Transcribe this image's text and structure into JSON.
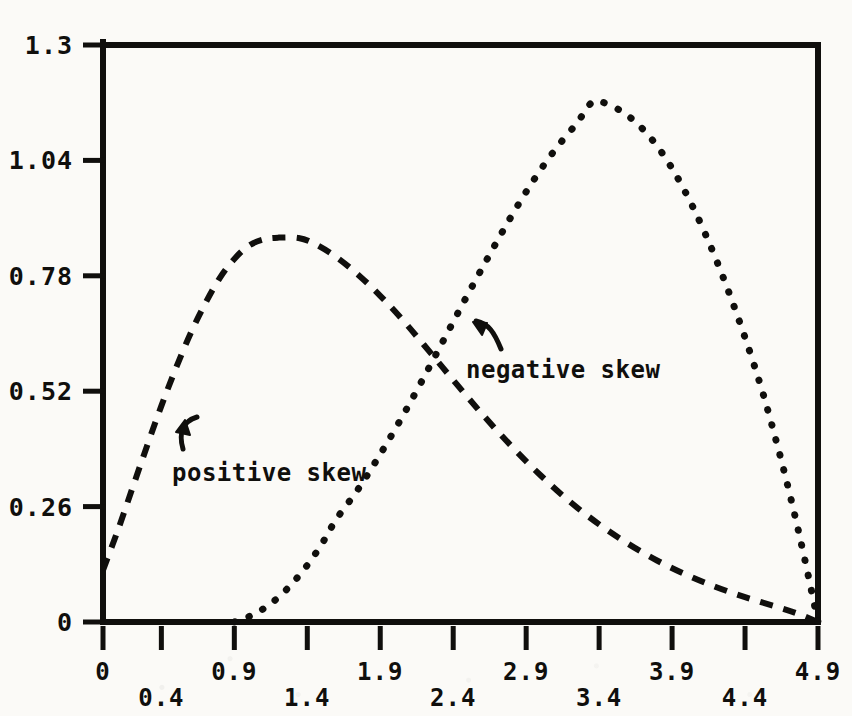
{
  "chart_data": {
    "type": "line",
    "title": "",
    "subtitle": "",
    "xlabel": "",
    "ylabel": "",
    "xlim": [
      0,
      4.9
    ],
    "ylim": [
      0,
      1.3
    ],
    "grid": false,
    "legend_position": "none",
    "x_tick_labels": [
      "0",
      "0.4",
      "0.9",
      "1.4",
      "1.9",
      "2.4",
      "2.9",
      "3.4",
      "3.9",
      "4.4",
      "4.9"
    ],
    "x_tick_values": [
      0,
      0.4,
      0.9,
      1.4,
      1.9,
      2.4,
      2.9,
      3.4,
      3.9,
      4.4,
      4.9
    ],
    "y_tick_labels": [
      "0",
      "0.26",
      "0.52",
      "0.78",
      "1.04",
      "1.3"
    ],
    "y_tick_values": [
      0,
      0.26,
      0.52,
      0.78,
      1.04,
      1.3
    ],
    "annotations": [
      {
        "text": "positive skew",
        "x": 0.72,
        "y": 0.41
      },
      {
        "text": "negative skew",
        "x": 2.6,
        "y": 0.62
      }
    ],
    "series": [
      {
        "name": "positive skew",
        "style": "dashed",
        "color": "#100f0d",
        "peak_x": 1.34,
        "peak_y": 0.865,
        "points": [
          [
            0.0,
            0.117
          ],
          [
            0.1,
            0.205
          ],
          [
            0.2,
            0.3
          ],
          [
            0.3,
            0.395
          ],
          [
            0.4,
            0.487
          ],
          [
            0.5,
            0.572
          ],
          [
            0.6,
            0.65
          ],
          [
            0.7,
            0.717
          ],
          [
            0.8,
            0.775
          ],
          [
            0.9,
            0.818
          ],
          [
            1.0,
            0.848
          ],
          [
            1.1,
            0.862
          ],
          [
            1.2,
            0.866
          ],
          [
            1.34,
            0.865
          ],
          [
            1.45,
            0.852
          ],
          [
            1.6,
            0.822
          ],
          [
            1.75,
            0.782
          ],
          [
            1.9,
            0.735
          ],
          [
            2.05,
            0.682
          ],
          [
            2.2,
            0.624
          ],
          [
            2.4,
            0.545
          ],
          [
            2.6,
            0.468
          ],
          [
            2.8,
            0.396
          ],
          [
            3.0,
            0.33
          ],
          [
            3.2,
            0.271
          ],
          [
            3.4,
            0.22
          ],
          [
            3.6,
            0.176
          ],
          [
            3.8,
            0.138
          ],
          [
            4.0,
            0.106
          ],
          [
            4.2,
            0.079
          ],
          [
            4.4,
            0.056
          ],
          [
            4.6,
            0.036
          ],
          [
            4.75,
            0.02
          ],
          [
            4.9,
            0.0
          ]
        ]
      },
      {
        "name": "negative skew",
        "style": "dotted",
        "color": "#100f0d",
        "peak_x": 3.35,
        "peak_y": 1.17,
        "points": [
          [
            0.9,
            0.0
          ],
          [
            1.0,
            0.012
          ],
          [
            1.1,
            0.03
          ],
          [
            1.2,
            0.055
          ],
          [
            1.3,
            0.088
          ],
          [
            1.4,
            0.128
          ],
          [
            1.5,
            0.176
          ],
          [
            1.6,
            0.232
          ],
          [
            1.75,
            0.3
          ],
          [
            1.9,
            0.378
          ],
          [
            2.05,
            0.462
          ],
          [
            2.2,
            0.552
          ],
          [
            2.35,
            0.645
          ],
          [
            2.5,
            0.738
          ],
          [
            2.65,
            0.828
          ],
          [
            2.8,
            0.915
          ],
          [
            2.95,
            0.995
          ],
          [
            3.1,
            1.065
          ],
          [
            3.25,
            1.125
          ],
          [
            3.35,
            1.17
          ],
          [
            3.45,
            1.168
          ],
          [
            3.6,
            1.14
          ],
          [
            3.75,
            1.092
          ],
          [
            3.9,
            1.022
          ],
          [
            4.05,
            0.93
          ],
          [
            4.2,
            0.818
          ],
          [
            4.35,
            0.688
          ],
          [
            4.5,
            0.54
          ],
          [
            4.62,
            0.4
          ],
          [
            4.72,
            0.27
          ],
          [
            4.81,
            0.14
          ],
          [
            4.9,
            0.0
          ]
        ]
      }
    ]
  },
  "axes": {
    "frame_color": "#100f0d",
    "left": 103,
    "right": 818,
    "top": 45,
    "bottom": 622
  }
}
